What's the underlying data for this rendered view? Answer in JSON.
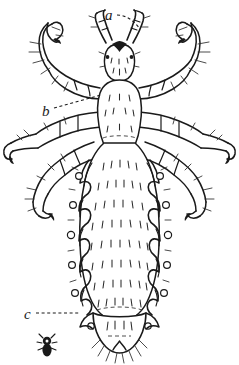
{
  "figure": {
    "kind": "scientific-line-drawing",
    "background_color": "#ffffff",
    "ink_color": "#1a1a1a",
    "width": 239,
    "height": 365
  },
  "labels": [
    {
      "id": "label-a",
      "text": "a",
      "x": 108,
      "y": 17,
      "target_x": 138,
      "target_y": 30,
      "leader": "dashed",
      "refers_to": "antenna"
    },
    {
      "id": "label-b",
      "text": "b",
      "x": 44,
      "y": 113,
      "target_x": 100,
      "target_y": 96,
      "leader": "dashed",
      "refers_to": "leg-claw"
    },
    {
      "id": "label-c",
      "text": "c",
      "x": 26,
      "y": 317,
      "target_x": 78,
      "target_y": 313,
      "leader": "dashed",
      "refers_to": "abdominal-margin-spiracle"
    }
  ],
  "parts": {
    "head_label": "head",
    "antenna_label": "antenna",
    "thorax_label": "thorax",
    "abdomen_label": "abdomen",
    "leg_label": "leg",
    "claw_label": "claw",
    "spiracle_label": "spiracle",
    "scale_figure_label": "actual-size-silhouette"
  },
  "counts": {
    "legs": 6,
    "antennae": 2,
    "spiracles_per_side": 6,
    "abdominal_segments": 8
  },
  "scale_figure": {
    "x": 40,
    "y": 338,
    "width": 14,
    "height": 20,
    "caption": ""
  }
}
